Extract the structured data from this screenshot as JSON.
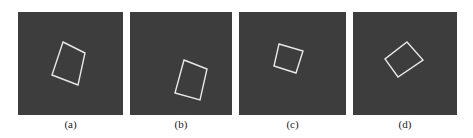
{
  "figure": {
    "panels": [
      {
        "label": "(a)",
        "left": 18,
        "width": 105,
        "square": [
          [
            45,
            30
          ],
          [
            67,
            41
          ],
          [
            60,
            73
          ],
          [
            34,
            63
          ]
        ]
      },
      {
        "label": "(b)",
        "left": 130,
        "width": 102,
        "square": [
          [
            54,
            48
          ],
          [
            77,
            57
          ],
          [
            70,
            88
          ],
          [
            45,
            81
          ]
        ]
      },
      {
        "label": "(c)",
        "left": 239,
        "width": 107,
        "square": [
          [
            40,
            32
          ],
          [
            64,
            39
          ],
          [
            57,
            61
          ],
          [
            35,
            54
          ]
        ]
      },
      {
        "label": "(d)",
        "left": 353,
        "width": 104,
        "square": [
          [
            54,
            30
          ],
          [
            70,
            48
          ],
          [
            45,
            65
          ],
          [
            32,
            47
          ]
        ]
      }
    ],
    "colors": {
      "background": "#3d3d3d",
      "square_stroke": "#e8e8e8"
    }
  }
}
